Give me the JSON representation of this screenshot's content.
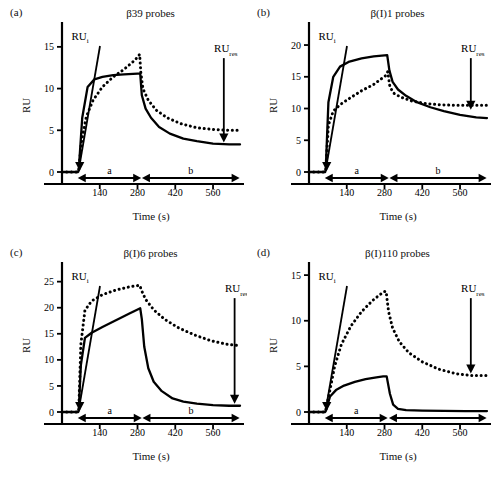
{
  "figure": {
    "axis_label_y": "RU",
    "axis_label_x": "Time (s)",
    "annotation_initial": "RU",
    "annotation_initial_sub": "i",
    "annotation_residual": "RU",
    "annotation_residual_sub": "res",
    "segment_association": "a",
    "segment_dissociation": "b",
    "xticks": [
      140,
      280,
      420,
      560
    ],
    "series_colors": {
      "solid": "#000000",
      "dotted": "#000000"
    }
  },
  "panels": [
    {
      "key": "a",
      "label": "(a)",
      "title": "β39 probes",
      "yticks": [
        0,
        5,
        10,
        15
      ],
      "ylim": [
        0,
        17.5
      ],
      "xlim": [
        0,
        660
      ],
      "seg_a": "a",
      "seg_b": "b"
    },
    {
      "key": "b",
      "label": "(b)",
      "title": "β(I)1 probes",
      "yticks": [
        0,
        5,
        10,
        15,
        20
      ],
      "ylim": [
        0,
        23
      ],
      "xlim": [
        0,
        660
      ],
      "seg_a": "a",
      "seg_b": "b"
    },
    {
      "key": "c",
      "label": "(c)",
      "title": "β(I)6 probes",
      "yticks": [
        0,
        5,
        10,
        15,
        20,
        25
      ],
      "ylim": [
        0,
        28
      ],
      "xlim": [
        0,
        660
      ],
      "seg_a": "a",
      "seg_b": "b"
    },
    {
      "key": "d",
      "label": "(d)",
      "title": "β(I)110 probes",
      "yticks": [
        0,
        5,
        10,
        15
      ],
      "ylim": [
        0,
        16
      ],
      "xlim": [
        0,
        660
      ],
      "seg_a": "a",
      "seg_b": ""
    }
  ],
  "chart_data": [
    {
      "type": "line",
      "panel": "a",
      "title": "β39 probes",
      "xlabel": "Time (s)",
      "ylabel": "RU",
      "xlim": [
        0,
        660
      ],
      "ylim": [
        0,
        17.5
      ],
      "xticks": [
        140,
        280,
        420,
        560
      ],
      "yticks": [
        0,
        5,
        10,
        15
      ],
      "grid": false,
      "legend": "none",
      "annotations": [
        {
          "text": "RU_i",
          "points_to_x": 62,
          "points_to_y": 0
        },
        {
          "text": "RU_res",
          "points_to_x": 600,
          "points_to_y": 3.3
        }
      ],
      "phases": [
        {
          "label": "a",
          "x_start": 62,
          "x_end": 290
        },
        {
          "label": "b",
          "x_start": 300,
          "x_end": 655
        }
      ],
      "series": [
        {
          "name": "solid",
          "style": "solid",
          "x": [
            0,
            60,
            62,
            75,
            95,
            120,
            150,
            190,
            230,
            280,
            290,
            296,
            310,
            330,
            360,
            400,
            450,
            500,
            560,
            620,
            660
          ],
          "y": [
            0,
            0,
            0.2,
            6.5,
            10.2,
            11.1,
            11.4,
            11.6,
            11.7,
            11.8,
            11.8,
            9.2,
            7.6,
            6.5,
            5.4,
            4.6,
            4.0,
            3.7,
            3.4,
            3.3,
            3.3
          ]
        },
        {
          "name": "dotted",
          "style": "dotted",
          "x": [
            0,
            60,
            62,
            72,
            90,
            115,
            150,
            190,
            230,
            270,
            288,
            292,
            300,
            320,
            350,
            390,
            440,
            500,
            560,
            620,
            660
          ],
          "y": [
            0,
            0,
            0.2,
            3.6,
            6.6,
            8.6,
            10.2,
            11.4,
            12.3,
            13.4,
            14.1,
            12.0,
            10.0,
            8.6,
            7.4,
            6.5,
            5.8,
            5.3,
            5.1,
            5.0,
            5.0
          ]
        }
      ]
    },
    {
      "type": "line",
      "panel": "b",
      "title": "β(I)1 probes",
      "xlabel": "Time (s)",
      "ylabel": "RU",
      "xlim": [
        0,
        660
      ],
      "ylim": [
        0,
        23
      ],
      "xticks": [
        140,
        280,
        420,
        560
      ],
      "yticks": [
        0,
        5,
        10,
        15,
        20
      ],
      "grid": false,
      "legend": "none",
      "annotations": [
        {
          "text": "RU_i",
          "points_to_x": 62,
          "points_to_y": 0
        },
        {
          "text": "RU_res",
          "points_to_x": 600,
          "points_to_y": 9.5
        }
      ],
      "phases": [
        {
          "label": "a",
          "x_start": 62,
          "x_end": 292
        },
        {
          "label": "b",
          "x_start": 302,
          "x_end": 655
        }
      ],
      "series": [
        {
          "name": "solid",
          "style": "solid",
          "x": [
            0,
            60,
            62,
            72,
            90,
            115,
            150,
            195,
            240,
            290,
            298,
            310,
            330,
            360,
            400,
            450,
            500,
            560,
            620,
            660
          ],
          "y": [
            0,
            0,
            0.3,
            11.0,
            15.0,
            16.6,
            17.4,
            17.9,
            18.2,
            18.4,
            16.0,
            14.2,
            13.0,
            12.0,
            11.0,
            10.2,
            9.6,
            9.0,
            8.6,
            8.5
          ]
        },
        {
          "name": "dotted",
          "style": "dotted",
          "x": [
            0,
            60,
            62,
            72,
            90,
            115,
            150,
            195,
            240,
            285,
            292,
            300,
            315,
            340,
            380,
            430,
            480,
            540,
            600,
            660
          ],
          "y": [
            0,
            0,
            0.3,
            7.4,
            9.6,
            10.6,
            11.6,
            12.8,
            13.8,
            15.2,
            15.8,
            13.4,
            12.4,
            11.8,
            11.2,
            10.8,
            10.6,
            10.5,
            10.5,
            10.5
          ]
        }
      ]
    },
    {
      "type": "line",
      "panel": "c",
      "title": "β(I)6 probes",
      "xlabel": "Time (s)",
      "ylabel": "RU",
      "xlim": [
        0,
        660
      ],
      "ylim": [
        0,
        28
      ],
      "xticks": [
        140,
        280,
        420,
        560
      ],
      "yticks": [
        0,
        5,
        10,
        15,
        20,
        25
      ],
      "grid": false,
      "legend": "none",
      "annotations": [
        {
          "text": "RU_i",
          "points_to_x": 62,
          "points_to_y": 0
        },
        {
          "text": "RU_res",
          "points_to_x": 640,
          "points_to_y": 1.2
        }
      ],
      "phases": [
        {
          "label": "a",
          "x_start": 62,
          "x_end": 292
        },
        {
          "label": "b",
          "x_start": 302,
          "x_end": 655
        }
      ],
      "series": [
        {
          "name": "solid",
          "style": "solid",
          "x": [
            0,
            60,
            62,
            70,
            85,
            110,
            150,
            200,
            250,
            290,
            296,
            305,
            320,
            340,
            370,
            410,
            450,
            500,
            560,
            620,
            660
          ],
          "y": [
            0,
            0,
            0.2,
            9.0,
            14.2,
            15.2,
            16.3,
            17.6,
            18.9,
            19.9,
            17.8,
            12.5,
            8.4,
            5.8,
            4.0,
            2.6,
            2.0,
            1.6,
            1.3,
            1.2,
            1.2
          ]
        },
        {
          "name": "dotted",
          "style": "dotted",
          "x": [
            0,
            60,
            62,
            70,
            85,
            110,
            150,
            200,
            250,
            288,
            296,
            310,
            340,
            380,
            430,
            490,
            550,
            610,
            660
          ],
          "y": [
            0,
            0,
            0.2,
            13.0,
            19.5,
            21.3,
            22.5,
            23.4,
            24.0,
            24.3,
            23.2,
            21.6,
            19.6,
            17.8,
            16.2,
            14.8,
            13.7,
            13.0,
            12.7
          ]
        }
      ]
    },
    {
      "type": "line",
      "panel": "d",
      "title": "β(I)110 probes",
      "xlabel": "Time (s)",
      "ylabel": "RU",
      "xlim": [
        0,
        660
      ],
      "ylim": [
        0,
        16
      ],
      "xticks": [
        140,
        280,
        420,
        560
      ],
      "yticks": [
        0,
        5,
        10,
        15
      ],
      "grid": false,
      "legend": "none",
      "annotations": [
        {
          "text": "RU_i",
          "points_to_x": 62,
          "points_to_y": 0
        },
        {
          "text": "RU_res",
          "points_to_x": 600,
          "points_to_y": 4.0
        }
      ],
      "phases": [
        {
          "label": "a",
          "x_start": 62,
          "x_end": 288
        },
        {
          "label": "",
          "x_start": 300,
          "x_end": 655
        }
      ],
      "series": [
        {
          "name": "solid",
          "style": "solid",
          "x": [
            0,
            60,
            62,
            78,
            100,
            130,
            170,
            210,
            250,
            275,
            282,
            288,
            300,
            312,
            330,
            360,
            420,
            500,
            580,
            660
          ],
          "y": [
            0,
            0,
            0.1,
            1.7,
            2.4,
            2.9,
            3.3,
            3.6,
            3.8,
            3.9,
            3.9,
            3.9,
            2.0,
            0.8,
            0.35,
            0.2,
            0.15,
            0.12,
            0.1,
            0.1
          ]
        },
        {
          "name": "dotted",
          "style": "dotted",
          "x": [
            0,
            60,
            62,
            75,
            95,
            120,
            155,
            195,
            235,
            265,
            280,
            286,
            295,
            310,
            335,
            370,
            420,
            480,
            545,
            600,
            660
          ],
          "y": [
            0,
            0,
            0.2,
            2.0,
            5.0,
            7.4,
            9.4,
            11.0,
            12.2,
            12.9,
            13.2,
            13.2,
            11.0,
            9.2,
            7.7,
            6.5,
            5.5,
            4.7,
            4.2,
            4.0,
            4.0
          ]
        }
      ]
    }
  ]
}
